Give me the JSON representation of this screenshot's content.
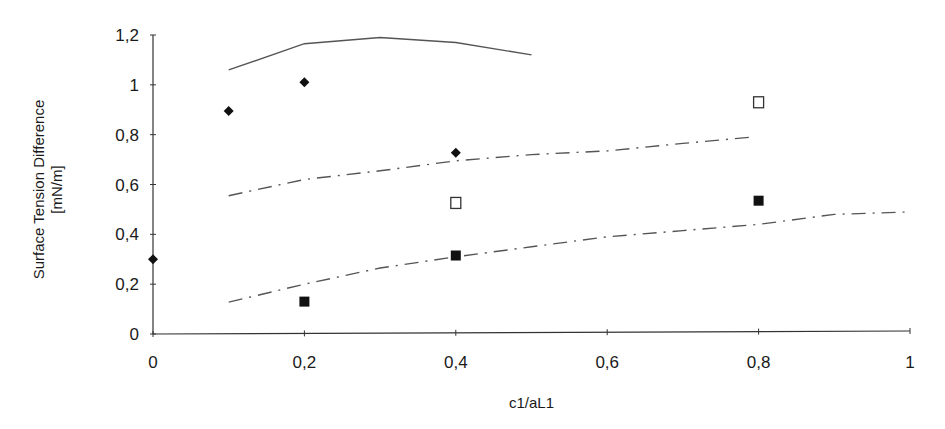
{
  "chart_data": {
    "type": "line",
    "title": "",
    "xlabel": "c1/aL1",
    "ylabel_lines": [
      "Surface Tension Difference",
      "[mN/m]"
    ],
    "xlim": [
      0,
      1
    ],
    "ylim": [
      0,
      1.2
    ],
    "grid": false,
    "legend": "none",
    "x_ticks": [
      0,
      0.2,
      0.4,
      0.6,
      0.8,
      1
    ],
    "x_tick_labels": [
      "0",
      "0,2",
      "0,4",
      "0,6",
      "0,8",
      "1"
    ],
    "y_ticks": [
      0,
      0.2,
      0.4,
      0.6,
      0.8,
      1,
      1.2
    ],
    "y_tick_labels": [
      "0",
      "0,2",
      "0,4",
      "0,6",
      "0,8",
      "1",
      "1,2"
    ],
    "series": [
      {
        "name": "solid-curve",
        "kind": "line",
        "style": "solid",
        "color": "#555555",
        "x": [
          0.1,
          0.2,
          0.3,
          0.4,
          0.5
        ],
        "y": [
          1.06,
          1.165,
          1.19,
          1.17,
          1.12
        ]
      },
      {
        "name": "upper-dashdot-curve",
        "kind": "line",
        "style": "dashdot",
        "color": "#555555",
        "x": [
          0.1,
          0.2,
          0.3,
          0.4,
          0.5,
          0.6,
          0.7,
          0.79
        ],
        "y": [
          0.555,
          0.62,
          0.655,
          0.695,
          0.72,
          0.735,
          0.765,
          0.79
        ]
      },
      {
        "name": "lower-dashdot-curve",
        "kind": "line",
        "style": "dashdot",
        "color": "#555555",
        "x": [
          0.1,
          0.2,
          0.3,
          0.4,
          0.5,
          0.6,
          0.7,
          0.8,
          0.9,
          1.0
        ],
        "y": [
          0.128,
          0.2,
          0.265,
          0.31,
          0.35,
          0.39,
          0.415,
          0.44,
          0.48,
          0.49
        ]
      },
      {
        "name": "filled-diamonds",
        "kind": "scatter",
        "marker": "diamond",
        "color": "#111111",
        "x": [
          0,
          0.1,
          0.2,
          0.4
        ],
        "y": [
          0.3,
          0.895,
          1.01,
          0.727
        ]
      },
      {
        "name": "open-squares",
        "kind": "scatter",
        "marker": "square-open",
        "color": "#333333",
        "x": [
          0.4,
          0.8
        ],
        "y": [
          0.526,
          0.93
        ]
      },
      {
        "name": "filled-squares",
        "kind": "scatter",
        "marker": "square",
        "color": "#111111",
        "x": [
          0.2,
          0.4,
          0.8
        ],
        "y": [
          0.13,
          0.315,
          0.535
        ]
      }
    ]
  }
}
